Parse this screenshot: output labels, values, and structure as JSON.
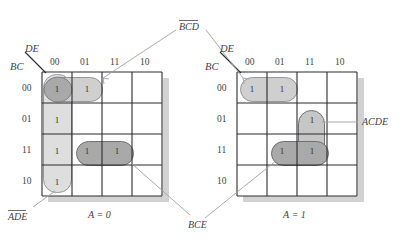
{
  "figure": {
    "type": "karnaugh-map-pair",
    "variables": [
      "A",
      "B",
      "C",
      "D",
      "E"
    ],
    "row_axis_label": "BC",
    "col_axis_label": "DE",
    "col_headers": [
      "00",
      "01",
      "11",
      "10"
    ],
    "row_headers": [
      "00",
      "01",
      "11",
      "10"
    ],
    "cell_value": "1"
  },
  "maps": [
    {
      "id": "map-a0",
      "caption": "A = 0",
      "ones": [
        {
          "row": "00",
          "col": "00"
        },
        {
          "row": "00",
          "col": "01"
        },
        {
          "row": "01",
          "col": "00"
        },
        {
          "row": "11",
          "col": "00"
        },
        {
          "row": "11",
          "col": "01"
        },
        {
          "row": "11",
          "col": "11"
        },
        {
          "row": "10",
          "col": "00"
        }
      ],
      "groups": [
        {
          "name": "ADE",
          "overbar": true,
          "cells": [
            [
              "00",
              "00"
            ],
            [
              "01",
              "00"
            ],
            [
              "11",
              "00"
            ],
            [
              "10",
              "00"
            ]
          ],
          "shade": "light"
        },
        {
          "name": "BCD",
          "overbar": true,
          "cells": [
            [
              "00",
              "00"
            ],
            [
              "00",
              "01"
            ]
          ],
          "shade": "dark"
        },
        {
          "name": "BCE",
          "overbar": false,
          "cells": [
            [
              "11",
              "01"
            ],
            [
              "11",
              "11"
            ]
          ],
          "shade": "dark"
        }
      ]
    },
    {
      "id": "map-a1",
      "caption": "A = 1",
      "ones": [
        {
          "row": "00",
          "col": "00"
        },
        {
          "row": "00",
          "col": "01"
        },
        {
          "row": "01",
          "col": "11"
        },
        {
          "row": "11",
          "col": "01"
        },
        {
          "row": "11",
          "col": "11"
        }
      ],
      "groups": [
        {
          "name": "BCD",
          "overbar": true,
          "cells": [
            [
              "00",
              "00"
            ],
            [
              "00",
              "01"
            ]
          ],
          "shade": "light"
        },
        {
          "name": "ACDE",
          "overbar": false,
          "cells": [
            [
              "01",
              "11"
            ],
            [
              "11",
              "11"
            ]
          ],
          "shade": "medium"
        },
        {
          "name": "BCE",
          "overbar": false,
          "cells": [
            [
              "11",
              "01"
            ],
            [
              "11",
              "11"
            ]
          ],
          "shade": "dark"
        }
      ]
    }
  ],
  "annotations": {
    "bcd": {
      "text": "BCD",
      "overbar": true
    },
    "ade": {
      "text": "ADE",
      "overbar": true
    },
    "bce": {
      "text": "BCE",
      "overbar": false
    },
    "acde": {
      "text": "ACDE",
      "overbar": false
    }
  },
  "colors": {
    "grid_line": "#2b2b2b",
    "text": "#3f3f44",
    "group_light": "#dcdcdc",
    "group_medium": "#c6c6c6",
    "group_dark": "#a8a8a8",
    "leader_line": "#9a9aa0",
    "shadow": "#cfcfcf",
    "background": "#ffffff"
  }
}
